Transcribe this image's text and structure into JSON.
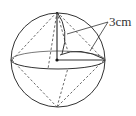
{
  "figure": {
    "label_text": "3cm",
    "colors": {
      "stroke": "#333333",
      "dash": "#444444",
      "background": "#ffffff"
    },
    "sphere": {
      "cx": 58,
      "cy": 60,
      "r": 47
    },
    "equator": {
      "cx": 58,
      "cy": 60,
      "rx": 47,
      "ry": 9
    },
    "center_point": {
      "x": 57,
      "y": 60
    },
    "annotation": {
      "text": "3cm",
      "points_to": [
        "vertical-radius-arc",
        "slant-edge"
      ]
    }
  }
}
